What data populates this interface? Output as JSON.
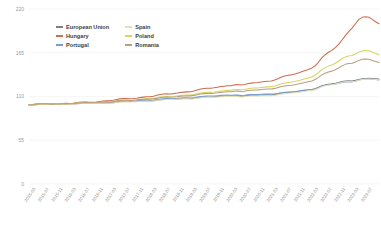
{
  "chart_data": {
    "type": "line",
    "title": "",
    "xlabel": "",
    "ylabel": "",
    "ylim": [
      0,
      220
    ],
    "yticks": [
      0,
      55,
      110,
      165,
      220
    ],
    "grid": true,
    "legend_position": "top-center",
    "x": [
      "2015-01",
      "2015-02",
      "2015-03",
      "2015-04",
      "2015-05",
      "2015-06",
      "2015-07",
      "2015-08",
      "2015-09",
      "2015-10",
      "2015-11",
      "2015-12",
      "2016-01",
      "2016-02",
      "2016-03",
      "2016-04",
      "2016-05",
      "2016-06",
      "2016-07",
      "2016-08",
      "2016-09",
      "2016-10",
      "2016-11",
      "2016-12",
      "2017-01",
      "2017-02",
      "2017-03",
      "2017-04",
      "2017-05",
      "2017-06",
      "2017-07",
      "2017-08",
      "2017-09",
      "2017-10",
      "2017-11",
      "2017-12",
      "2018-01",
      "2018-02",
      "2018-03",
      "2018-04",
      "2018-05",
      "2018-06",
      "2018-07",
      "2018-08",
      "2018-09",
      "2018-10",
      "2018-11",
      "2018-12",
      "2019-01",
      "2019-02",
      "2019-03",
      "2019-04",
      "2019-05",
      "2019-06",
      "2019-07",
      "2019-08",
      "2019-09",
      "2019-10",
      "2019-11",
      "2019-12",
      "2020-01",
      "2020-02",
      "2020-03",
      "2020-04",
      "2020-05",
      "2020-06",
      "2020-07",
      "2020-08",
      "2020-09",
      "2020-10",
      "2020-11",
      "2020-12",
      "2021-01",
      "2021-02",
      "2021-03",
      "2021-04",
      "2021-05",
      "2021-06",
      "2021-07",
      "2021-08",
      "2021-09",
      "2021-10",
      "2021-11",
      "2021-12",
      "2022-01",
      "2022-02",
      "2022-03",
      "2022-04",
      "2022-05",
      "2022-06",
      "2022-07",
      "2022-08",
      "2022-09",
      "2022-10",
      "2022-11",
      "2022-12",
      "2023-01",
      "2023-02",
      "2023-03",
      "2023-04",
      "2023-05",
      "2023-06",
      "2023-07",
      "2023-08",
      "2023-09"
    ],
    "xtick_labels": [
      "2015-03",
      "2015-07",
      "2015-11",
      "2016-03",
      "2016-07",
      "2016-11",
      "2017-03",
      "2017-07",
      "2017-11",
      "2018-03",
      "2018-07",
      "2018-11",
      "2019-03",
      "2019-07",
      "2019-11",
      "2020-03",
      "2020-07",
      "2020-11",
      "2021-03",
      "2021-07",
      "2021-11",
      "2022-03",
      "2022-07",
      "2022-11",
      "2023-03",
      "2023-07"
    ],
    "xtick_indices": [
      2,
      6,
      10,
      14,
      18,
      22,
      26,
      30,
      34,
      38,
      42,
      46,
      50,
      54,
      58,
      62,
      66,
      70,
      74,
      78,
      82,
      86,
      90,
      94,
      98,
      102
    ],
    "series": [
      {
        "name": "European Union",
        "color": "#7f7f7f",
        "values": [
          99.2,
          99.4,
          99.8,
          100.1,
          100.4,
          100.5,
          100.4,
          100.3,
          100.3,
          100.4,
          100.6,
          100.7,
          100.3,
          100.4,
          100.8,
          101.2,
          101.4,
          101.5,
          101.4,
          101.4,
          101.5,
          101.7,
          102.0,
          102.2,
          101.9,
          102.2,
          102.8,
          103.4,
          103.6,
          103.7,
          103.6,
          103.7,
          103.9,
          104.2,
          104.5,
          104.8,
          104.4,
          104.7,
          105.3,
          106.0,
          106.4,
          106.6,
          106.5,
          106.7,
          107.0,
          107.3,
          107.4,
          107.5,
          107.2,
          107.6,
          108.3,
          109.1,
          109.3,
          109.5,
          109.5,
          109.7,
          110.0,
          110.3,
          110.5,
          110.8,
          110.6,
          111.0,
          110.8,
          110.3,
          110.6,
          111.2,
          111.5,
          111.6,
          111.6,
          111.9,
          112.0,
          112.2,
          112.0,
          112.4,
          113.1,
          114.0,
          114.6,
          115.1,
          115.4,
          115.8,
          116.3,
          117.0,
          117.6,
          118.3,
          118.5,
          119.6,
          121.2,
          123.4,
          124.6,
          125.4,
          125.9,
          126.6,
          127.5,
          128.9,
          129.6,
          129.8,
          129.4,
          130.3,
          131.5,
          132.4,
          132.7,
          132.9,
          132.6,
          132.3,
          131.9
        ]
      },
      {
        "name": "Hungary",
        "color": "#cf6b50",
        "values": [
          99.5,
          99.8,
          100.4,
          100.8,
          101.0,
          101.0,
          100.6,
          100.4,
          100.5,
          100.8,
          101.2,
          101.5,
          101.2,
          101.4,
          102.1,
          102.7,
          103.0,
          103.0,
          102.8,
          102.8,
          103.1,
          103.6,
          104.2,
          104.6,
          104.6,
          105.2,
          106.2,
          107.0,
          107.4,
          107.4,
          107.2,
          107.4,
          107.9,
          108.6,
          109.2,
          109.8,
          109.8,
          110.4,
          111.5,
          112.5,
          113.1,
          113.4,
          113.2,
          113.6,
          114.3,
          115.1,
          115.5,
          115.8,
          115.9,
          116.8,
          118.1,
          119.4,
          120.0,
          120.4,
          120.4,
          120.9,
          121.7,
          122.5,
          123.0,
          123.4,
          123.6,
          124.6,
          125.0,
          124.4,
          125.0,
          126.1,
          126.8,
          127.2,
          127.5,
          128.3,
          128.8,
          129.2,
          129.5,
          130.7,
          132.4,
          134.4,
          135.7,
          136.6,
          137.2,
          138.2,
          139.5,
          141.2,
          142.6,
          144.0,
          145.6,
          148.6,
          153.0,
          158.5,
          162.5,
          165.6,
          168.0,
          171.5,
          175.5,
          181.0,
          186.5,
          191.5,
          196.0,
          201.5,
          207.0,
          209.5,
          210.2,
          209.6,
          207.0,
          204.0,
          201.5
        ]
      },
      {
        "name": "Portugal",
        "color": "#7a9dc9",
        "values": [
          99.4,
          99.6,
          100.0,
          100.3,
          100.5,
          100.5,
          100.3,
          100.2,
          100.3,
          100.4,
          100.6,
          100.8,
          100.6,
          100.8,
          101.2,
          101.6,
          101.8,
          101.8,
          101.6,
          101.6,
          101.8,
          102.1,
          102.4,
          102.6,
          102.4,
          102.8,
          103.4,
          104.0,
          104.3,
          104.3,
          104.1,
          104.2,
          104.5,
          104.9,
          105.2,
          105.5,
          105.2,
          105.6,
          106.2,
          106.9,
          107.2,
          107.4,
          107.2,
          107.4,
          107.7,
          108.1,
          108.3,
          108.5,
          108.2,
          108.7,
          109.4,
          110.1,
          110.4,
          110.6,
          110.5,
          110.7,
          111.0,
          111.4,
          111.6,
          111.9,
          111.6,
          112.0,
          111.8,
          111.2,
          111.5,
          112.1,
          112.4,
          112.5,
          112.5,
          112.8,
          113.0,
          113.2,
          113.0,
          113.4,
          114.0,
          114.8,
          115.3,
          115.7,
          115.9,
          116.3,
          116.8,
          117.4,
          118.0,
          118.6,
          118.8,
          119.8,
          121.2,
          123.0,
          124.1,
          124.8,
          125.2,
          125.8,
          126.5,
          127.6,
          128.3,
          128.7,
          128.4,
          129.3,
          130.6,
          131.6,
          131.9,
          132.0,
          131.7,
          131.3,
          130.9
        ]
      },
      {
        "name": "Spain",
        "color": "#e3dfb6",
        "values": [
          99.0,
          99.2,
          99.6,
          99.9,
          100.2,
          100.3,
          100.2,
          100.1,
          100.1,
          100.2,
          100.4,
          100.5,
          100.0,
          100.1,
          100.5,
          100.9,
          101.1,
          101.2,
          101.1,
          101.1,
          101.2,
          101.4,
          101.7,
          101.9,
          101.5,
          101.8,
          102.4,
          103.0,
          103.2,
          103.3,
          103.2,
          103.3,
          103.5,
          103.8,
          104.1,
          104.4,
          104.0,
          104.3,
          104.9,
          105.6,
          106.0,
          106.2,
          106.1,
          106.3,
          106.6,
          106.9,
          107.0,
          107.1,
          106.7,
          107.1,
          107.8,
          108.5,
          108.7,
          108.9,
          108.9,
          109.1,
          109.4,
          109.7,
          109.9,
          110.2,
          110.0,
          110.4,
          110.1,
          109.4,
          109.6,
          110.2,
          110.5,
          110.6,
          110.6,
          110.9,
          111.0,
          111.2,
          111.0,
          111.4,
          112.1,
          113.0,
          113.6,
          114.1,
          114.4,
          114.8,
          115.3,
          116.0,
          116.6,
          117.3,
          117.5,
          118.6,
          120.2,
          122.4,
          123.6,
          124.4,
          124.9,
          125.6,
          126.5,
          127.9,
          128.6,
          128.8,
          128.4,
          129.3,
          130.5,
          131.4,
          131.7,
          131.9,
          131.6,
          131.3,
          130.9
        ]
      },
      {
        "name": "Poland",
        "color": "#d7d45f",
        "values": [
          99.3,
          99.6,
          100.1,
          100.5,
          100.7,
          100.8,
          100.5,
          100.4,
          100.5,
          100.7,
          101.0,
          101.2,
          100.9,
          101.1,
          101.6,
          102.1,
          102.3,
          102.4,
          102.2,
          102.2,
          102.4,
          102.8,
          103.2,
          103.5,
          103.3,
          103.7,
          104.5,
          105.2,
          105.5,
          105.6,
          105.4,
          105.6,
          105.9,
          106.4,
          106.9,
          107.3,
          107.1,
          107.6,
          108.5,
          109.3,
          109.8,
          110.0,
          109.8,
          110.1,
          110.6,
          111.2,
          111.6,
          111.9,
          111.8,
          112.5,
          113.5,
          114.5,
          115.0,
          115.3,
          115.2,
          115.6,
          116.2,
          116.9,
          117.3,
          117.7,
          117.8,
          118.6,
          118.9,
          118.4,
          118.9,
          119.8,
          120.3,
          120.6,
          120.8,
          121.4,
          121.8,
          122.1,
          122.3,
          123.2,
          124.5,
          126.0,
          127.0,
          127.7,
          128.1,
          128.9,
          129.9,
          131.2,
          132.3,
          133.4,
          134.5,
          136.8,
          140.0,
          143.8,
          146.3,
          148.2,
          149.6,
          151.8,
          154.3,
          157.5,
          159.8,
          161.0,
          161.5,
          163.5,
          165.8,
          167.3,
          167.8,
          167.4,
          165.8,
          164.0,
          162.5
        ]
      },
      {
        "name": "Romania",
        "color": "#b99d7e",
        "values": [
          99.4,
          99.7,
          100.2,
          100.6,
          100.8,
          100.8,
          100.5,
          100.4,
          100.5,
          100.7,
          101.0,
          101.2,
          100.8,
          101.0,
          101.5,
          102.0,
          102.2,
          102.3,
          102.1,
          102.1,
          102.3,
          102.7,
          103.1,
          103.4,
          103.1,
          103.5,
          104.2,
          104.9,
          105.2,
          105.3,
          105.1,
          105.3,
          105.6,
          106.1,
          106.5,
          106.9,
          106.6,
          107.1,
          107.9,
          108.7,
          109.1,
          109.3,
          109.1,
          109.4,
          109.8,
          110.4,
          110.7,
          111.0,
          110.8,
          111.4,
          112.3,
          113.2,
          113.6,
          113.9,
          113.8,
          114.1,
          114.6,
          115.2,
          115.6,
          115.9,
          115.9,
          116.6,
          116.8,
          116.3,
          116.7,
          117.5,
          117.9,
          118.2,
          118.3,
          118.8,
          119.1,
          119.4,
          119.5,
          120.2,
          121.3,
          122.5,
          123.3,
          123.9,
          124.2,
          124.9,
          125.7,
          126.8,
          127.7,
          128.6,
          129.4,
          131.3,
          134.0,
          137.2,
          139.2,
          140.8,
          141.9,
          143.7,
          145.8,
          148.5,
          150.4,
          151.4,
          151.8,
          153.5,
          155.4,
          156.7,
          157.1,
          156.8,
          155.4,
          153.9,
          152.6
        ]
      }
    ]
  },
  "legend": {
    "items": [
      {
        "label": "European Union"
      },
      {
        "label": "Hungary"
      },
      {
        "label": "Portugal"
      },
      {
        "label": "Spain"
      },
      {
        "label": "Poland"
      },
      {
        "label": "Romania"
      }
    ]
  }
}
